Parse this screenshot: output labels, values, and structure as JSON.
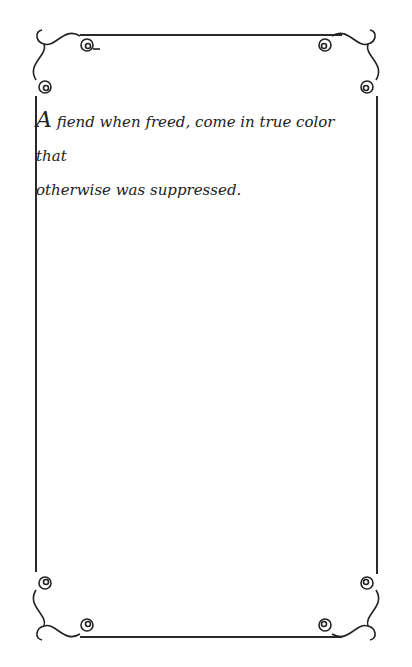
{
  "page": {
    "header_fragment": "... n mo ...",
    "quote": {
      "drop_cap": "A",
      "line1": " fiend when freed, come in true color that",
      "line2": "otherwise was suppressed."
    },
    "frame": {
      "line_color": "#2a2a2a",
      "ornament": "scroll-flourish corners"
    }
  }
}
